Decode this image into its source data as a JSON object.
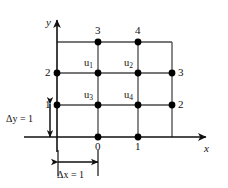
{
  "figure": {
    "type": "finite-difference-grid",
    "background_color": "#ffffff",
    "line_color": "#3a3a3a",
    "axis_color": "#111111",
    "node_color": "#000000",
    "text_color": "#111111",
    "width": 228,
    "height": 188
  },
  "axes": {
    "x_label": "x",
    "y_label": "y",
    "x_axis_y_px": 137,
    "y_axis_x_px": 57,
    "x_arrow_tip_px": 212,
    "y_arrow_tip_px": 16
  },
  "grid": {
    "x_positions_px": [
      57,
      98,
      138,
      172
    ],
    "y_positions_px": [
      42,
      73,
      105,
      137
    ],
    "spacing_x": 1,
    "spacing_y": 1
  },
  "unknowns": [
    {
      "label": "u",
      "subscript": "1",
      "x_px": 98,
      "y_px": 73
    },
    {
      "label": "u",
      "subscript": "2",
      "x_px": 138,
      "y_px": 73
    },
    {
      "label": "u",
      "subscript": "3",
      "x_px": 98,
      "y_px": 105
    },
    {
      "label": "u",
      "subscript": "4",
      "x_px": 138,
      "y_px": 105
    }
  ],
  "boundary_labels": {
    "top": [
      {
        "value": "3",
        "x_px": 98,
        "y_px": 42
      },
      {
        "value": "4",
        "x_px": 138,
        "y_px": 42
      }
    ],
    "left": [
      {
        "value": "2",
        "x_px": 57,
        "y_px": 73
      },
      {
        "value": "1",
        "x_px": 57,
        "y_px": 105
      }
    ],
    "right": [
      {
        "value": "3",
        "x_px": 172,
        "y_px": 73
      },
      {
        "value": "2",
        "x_px": 172,
        "y_px": 105
      }
    ],
    "bottom": [
      {
        "value": "0",
        "x_px": 98,
        "y_px": 137
      },
      {
        "value": "1",
        "x_px": 138,
        "y_px": 137
      }
    ]
  },
  "annotations": {
    "delta_y": "Δy = 1",
    "delta_x": "Δx = 1"
  }
}
